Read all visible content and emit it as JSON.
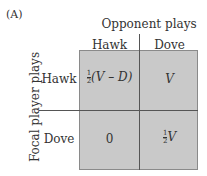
{
  "panel_label": "(A)",
  "column_title": "Opponent plays",
  "row_title": "Focal player plays",
  "columns": [
    "Hawk",
    "Dove"
  ],
  "rows": [
    "Hawk",
    "Dove"
  ],
  "cells": {
    "hawk_hawk": {
      "coef_num": "1",
      "coef_den": "2",
      "expr": "(V – D)"
    },
    "hawk_dove": {
      "expr": "V"
    },
    "dove_hawk": {
      "expr": "0"
    },
    "dove_dove": {
      "coef_num": "1",
      "coef_den": "2",
      "expr": "V"
    }
  },
  "colors": {
    "cell_fill": "#c9c9c9",
    "lines": "#555555"
  }
}
